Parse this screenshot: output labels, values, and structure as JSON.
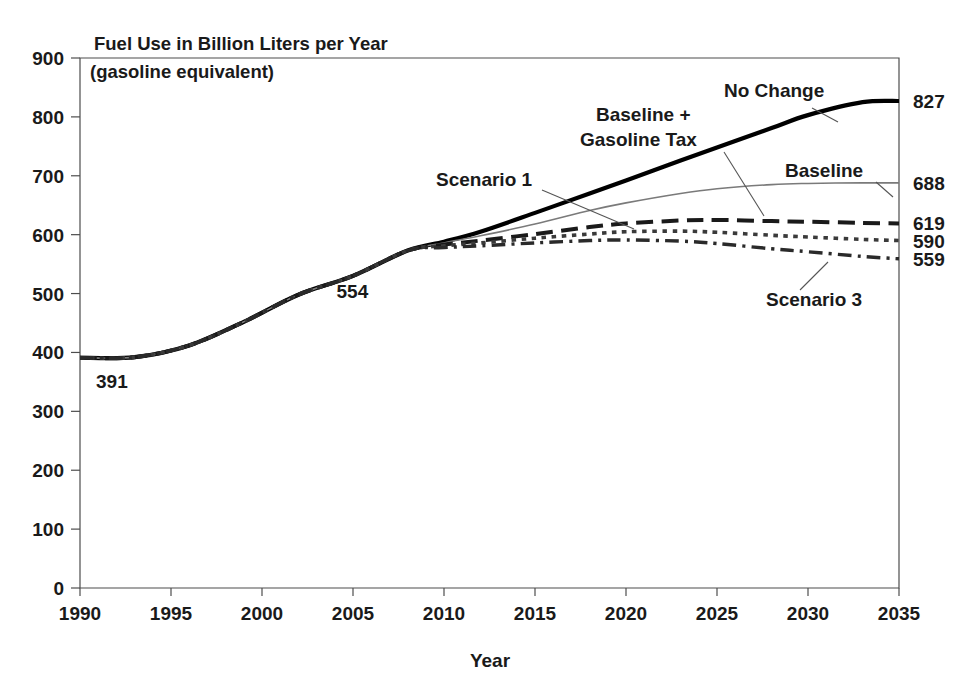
{
  "chart_data": {
    "type": "line",
    "title": "Fuel Use in Billion Liters per Year",
    "subtitle": "(gasoline equivalent)",
    "xlabel": "Year",
    "ylabel": "",
    "xlim": [
      1990,
      2035
    ],
    "ylim": [
      0,
      900
    ],
    "grid": false,
    "legend_position": "inline-annotations",
    "xticks": [
      "1990",
      "1995",
      "2000",
      "2005",
      "2010",
      "2015",
      "2020",
      "2025",
      "2030",
      "2035"
    ],
    "xtick_values": [
      1990,
      1995,
      2000,
      2005,
      2010,
      2015,
      2020,
      2025,
      2030,
      2035
    ],
    "yticks": [
      "0",
      "100",
      "200",
      "300",
      "400",
      "500",
      "600",
      "700",
      "800",
      "900"
    ],
    "ytick_values": [
      0,
      100,
      200,
      300,
      400,
      500,
      600,
      700,
      800,
      900
    ],
    "x": [
      1990,
      1993,
      1996,
      1999,
      2002,
      2005,
      2008,
      2010,
      2012,
      2015,
      2018,
      2020,
      2023,
      2025,
      2028,
      2030,
      2033,
      2035
    ],
    "series": [
      {
        "name": "No Change",
        "style": "solid-thick",
        "color": "#000000",
        "width": 4.2,
        "end_value": 827,
        "values": [
          391,
          392,
          412,
          452,
          498,
          530,
          573,
          588,
          605,
          637,
          670,
          692,
          726,
          748,
          781,
          803,
          825,
          827
        ]
      },
      {
        "name": "Baseline",
        "style": "solid-thin",
        "color": "#7a7a7a",
        "width": 1.6,
        "end_value": 688,
        "values": [
          391,
          392,
          412,
          452,
          498,
          530,
          573,
          586,
          598,
          618,
          641,
          654,
          670,
          678,
          685,
          687,
          688,
          688
        ]
      },
      {
        "name": "Scenario 1",
        "style": "dashed",
        "color": "#1a1a1a",
        "width": 4.0,
        "end_value": 619,
        "values": [
          391,
          392,
          412,
          452,
          498,
          530,
          573,
          583,
          590,
          601,
          613,
          619,
          624,
          625,
          623,
          622,
          620,
          619
        ]
      },
      {
        "name": "Baseline + Gasoline Tax",
        "style": "dotted",
        "color": "#3a3a3a",
        "width": 3.6,
        "end_value": 590,
        "values": [
          391,
          392,
          412,
          452,
          498,
          530,
          573,
          581,
          586,
          594,
          601,
          605,
          606,
          604,
          599,
          596,
          592,
          590
        ]
      },
      {
        "name": "Scenario 3",
        "style": "dash-dot",
        "color": "#2a2a2a",
        "width": 3.4,
        "end_value": 559,
        "values": [
          391,
          392,
          412,
          452,
          498,
          530,
          573,
          578,
          581,
          586,
          590,
          591,
          589,
          585,
          576,
          571,
          563,
          559
        ]
      }
    ],
    "point_annotations": [
      {
        "label": "391",
        "x": 1990,
        "y": 391,
        "dx": 16,
        "dy": 30
      },
      {
        "label": "554",
        "x": 2003.6,
        "y": 554,
        "dx": 9,
        "dy": 36
      }
    ],
    "end_labels": [
      {
        "label": "827",
        "value": 827
      },
      {
        "label": "688",
        "value": 688
      },
      {
        "label": "619",
        "value": 619
      },
      {
        "label": "590",
        "value": 590
      },
      {
        "label": "559",
        "value": 559
      }
    ],
    "annotations": [
      {
        "label": "No Change",
        "text_x": 724,
        "text_y": 97,
        "anchor": "start",
        "leader": [
          [
            812,
            108
          ],
          [
            838,
            122
          ]
        ]
      },
      {
        "label": "Baseline",
        "text_x": 785,
        "text_y": 177,
        "anchor": "start",
        "leader": [
          [
            876,
            182
          ],
          [
            893,
            197
          ]
        ]
      },
      {
        "label": "Scenario 1",
        "text_x": 436,
        "text_y": 186,
        "anchor": "start",
        "leader": [
          [
            542,
            190
          ],
          [
            634,
            229
          ]
        ]
      },
      {
        "label": "Baseline +",
        "text_x": 596,
        "text_y": 121,
        "anchor": "start",
        "leader": null
      },
      {
        "label": "Gasoline Tax",
        "text_x": 580,
        "text_y": 146,
        "anchor": "start",
        "leader": [
          [
            724,
            152
          ],
          [
            764,
            216
          ]
        ]
      },
      {
        "label": "Scenario 3",
        "text_x": 766,
        "text_y": 306,
        "anchor": "start",
        "leader": [
          [
            800,
            290
          ],
          [
            828,
            262
          ]
        ]
      }
    ]
  },
  "layout": {
    "plot_left": 80,
    "plot_right": 899,
    "plot_top": 58,
    "plot_bottom": 588
  }
}
